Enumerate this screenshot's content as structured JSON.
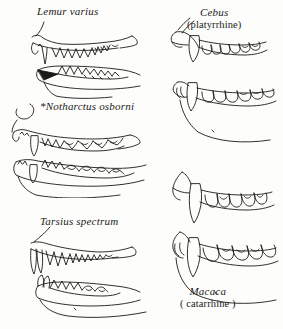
{
  "figure": {
    "kind": "comparative-anatomy-line-drawing",
    "background_color": "#fdfdfc",
    "ink_color": "#1b1a18",
    "columns": 2,
    "panel_count": 5
  },
  "panels": [
    {
      "id": "lemur",
      "column": "left",
      "sciname": "Lemur varius",
      "common": "",
      "has_leader_line": true,
      "views": [
        "upper jaw",
        "lower jaw"
      ],
      "note": "lower jaw shows solid dark procumbent tooth comb"
    },
    {
      "id": "notharctus",
      "column": "left",
      "sciname": "*Notharctus osborni",
      "common": "",
      "has_leader_line": true,
      "views": [
        "upper jaw",
        "lower jaw"
      ],
      "note": "asterisk marks extinct fossil form"
    },
    {
      "id": "tarsius",
      "column": "left",
      "sciname": "Tarsius spectrum",
      "common": "",
      "has_leader_line": true,
      "views": [
        "upper jaw",
        "lower jaw"
      ],
      "note": "long sharp procumbent incisors"
    },
    {
      "id": "cebus",
      "column": "right",
      "sciname": "Cebus",
      "common": "(platyrrhine)",
      "has_leader_line": true,
      "views": [
        "upper jaw",
        "lower jaw"
      ],
      "note": "prominent anterior canine in both jaws"
    },
    {
      "id": "macaca",
      "column": "right",
      "sciname": "Macaca",
      "common": "( catarrhine )",
      "has_leader_line": false,
      "views": [
        "upper jaw",
        "lower jaw"
      ],
      "note": "very large elongated canines"
    }
  ]
}
